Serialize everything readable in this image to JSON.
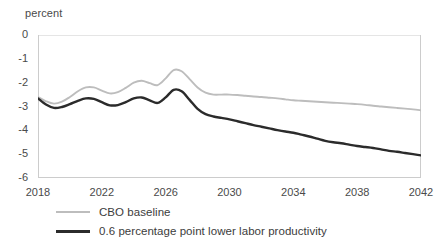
{
  "chart_data": {
    "type": "line",
    "title": "",
    "subtitle": "",
    "xlabel": "",
    "ylabel": "percent",
    "xlim": [
      2018,
      2042
    ],
    "ylim": [
      -6,
      0
    ],
    "grid": false,
    "legend_position": "bottom-left",
    "x_ticks": [
      "2018",
      "2022",
      "2026",
      "2030",
      "2034",
      "2038",
      "2042"
    ],
    "y_ticks": [
      "0",
      "-1",
      "-2",
      "-3",
      "-4",
      "-5",
      "-6"
    ],
    "x": [
      2018,
      2018.5,
      2019,
      2019.5,
      2020,
      2020.5,
      2021,
      2021.5,
      2022,
      2022.5,
      2023,
      2023.5,
      2024,
      2024.5,
      2025,
      2025.5,
      2026,
      2026.5,
      2027,
      2027.5,
      2028,
      2028.5,
      2029,
      2029.5,
      2030,
      2030.5,
      2031,
      2031.5,
      2032,
      2032.5,
      2033,
      2033.5,
      2034,
      2034.5,
      2035,
      2035.5,
      2036,
      2036.5,
      2037,
      2037.5,
      2038,
      2038.5,
      2039,
      2039.5,
      2040,
      2040.5,
      2041,
      2041.5,
      2042
    ],
    "series": [
      {
        "name": "CBO baseline",
        "color": "#bdbdbd",
        "values": [
          -2.6,
          -2.78,
          -2.88,
          -2.8,
          -2.6,
          -2.36,
          -2.2,
          -2.2,
          -2.33,
          -2.45,
          -2.4,
          -2.22,
          -2.0,
          -1.92,
          -2.02,
          -2.1,
          -1.82,
          -1.47,
          -1.52,
          -1.85,
          -2.2,
          -2.42,
          -2.5,
          -2.5,
          -2.5,
          -2.52,
          -2.55,
          -2.58,
          -2.6,
          -2.63,
          -2.66,
          -2.7,
          -2.74,
          -2.76,
          -2.78,
          -2.8,
          -2.82,
          -2.84,
          -2.86,
          -2.88,
          -2.9,
          -2.93,
          -2.97,
          -3.0,
          -3.03,
          -3.06,
          -3.09,
          -3.12,
          -3.16
        ]
      },
      {
        "name": "0.6 percentage point lower labor productivity",
        "color": "#2b2b2b",
        "values": [
          -2.66,
          -2.92,
          -3.06,
          -3.02,
          -2.9,
          -2.76,
          -2.66,
          -2.68,
          -2.82,
          -2.95,
          -2.94,
          -2.82,
          -2.66,
          -2.62,
          -2.74,
          -2.85,
          -2.62,
          -2.3,
          -2.36,
          -2.72,
          -3.1,
          -3.32,
          -3.42,
          -3.48,
          -3.54,
          -3.62,
          -3.7,
          -3.78,
          -3.85,
          -3.92,
          -3.99,
          -4.05,
          -4.1,
          -4.18,
          -4.26,
          -4.35,
          -4.44,
          -4.5,
          -4.54,
          -4.6,
          -4.66,
          -4.7,
          -4.74,
          -4.8,
          -4.86,
          -4.9,
          -4.95,
          -5.0,
          -5.05
        ]
      }
    ]
  },
  "legend": [
    {
      "label": "CBO baseline"
    },
    {
      "label": "0.6 percentage point lower labor productivity"
    }
  ]
}
